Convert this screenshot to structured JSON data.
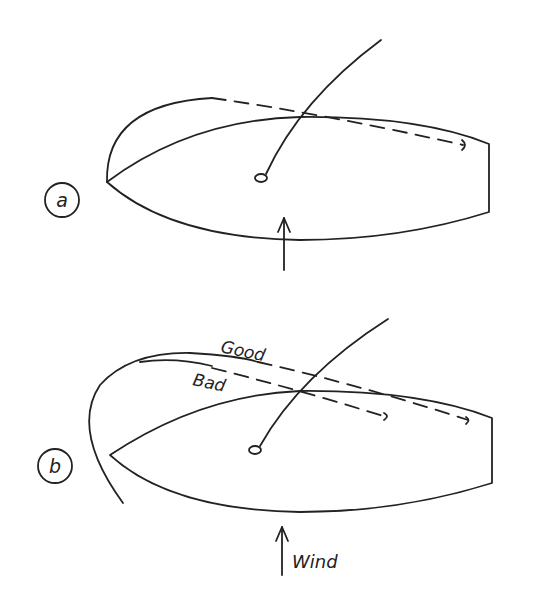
{
  "figure": {
    "panels": [
      {
        "id": "a",
        "label": "a",
        "arrow_label": ""
      },
      {
        "id": "b",
        "label": "b",
        "curve_labels": {
          "good": "Good",
          "bad": "Bad"
        },
        "arrow_label": "Wind"
      }
    ],
    "colors": {
      "ink": "#222222",
      "background": "#ffffff"
    }
  }
}
